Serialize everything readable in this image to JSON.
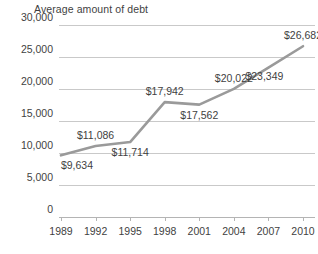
{
  "chart_data": {
    "type": "line",
    "title": "Average amount of debt",
    "xlabel": "",
    "ylabel": "",
    "categories": [
      "1989",
      "1992",
      "1995",
      "1998",
      "2001",
      "2004",
      "2007",
      "2010"
    ],
    "values": [
      9634,
      11086,
      11714,
      17942,
      17562,
      20022,
      23349,
      26682
    ],
    "point_labels": [
      "$9,634",
      "$11,086",
      "$11,714",
      "$17,942",
      "$17,562",
      "$20,022",
      "$23,349",
      "$26,682"
    ],
    "label_placement": [
      "below-left",
      "above",
      "below",
      "above",
      "below",
      "above",
      "below-right",
      "above"
    ],
    "ylim": [
      0,
      30000
    ],
    "ytick_values": [
      0,
      5000,
      10000,
      15000,
      20000,
      25000,
      30000
    ],
    "ytick_labels": [
      "0",
      "5,000",
      "10,000",
      "15,000",
      "20,000",
      "25,000",
      "30,000"
    ],
    "grid": true,
    "legend": "none",
    "series": [
      {
        "name": "Average amount of debt",
        "color": "#9a9a9a",
        "values": [
          9634,
          11086,
          11714,
          17942,
          17562,
          20022,
          23349,
          26682
        ]
      }
    ],
    "colors": {
      "line": "#9a9a9a",
      "gridline": "#c9c9c9",
      "axis": "#b4b4b4",
      "text": "#3f3f3f",
      "background": "#ffffff"
    }
  }
}
